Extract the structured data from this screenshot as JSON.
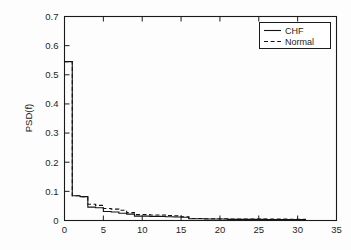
{
  "chart_data": {
    "type": "line",
    "title": "",
    "subtitle": "",
    "xlabel": "",
    "ylabel": "PSD(f)",
    "xlim": [
      0,
      35
    ],
    "ylim": [
      0,
      0.7
    ],
    "xticks": [
      0,
      5,
      10,
      15,
      20,
      25,
      30,
      35
    ],
    "xtick_labels": [
      "0",
      "5",
      "10",
      "15",
      "20",
      "25",
      "30",
      "35"
    ],
    "yticks": [
      0,
      0.1,
      0.2,
      0.3,
      0.4,
      0.5,
      0.6,
      0.7
    ],
    "ytick_labels": [
      "0",
      "0.1",
      "0.2",
      "0.3",
      "0.4",
      "0.5",
      "0.6",
      "0.7"
    ],
    "grid": false,
    "drawstyle": "steps-post",
    "legend_position": "top-right",
    "legend": [
      "CHF",
      "Normal"
    ],
    "x": [
      0,
      1,
      2,
      3,
      4,
      5,
      6,
      7,
      8,
      9,
      10,
      11,
      12,
      13,
      14,
      15,
      16,
      17,
      18,
      19,
      20,
      21,
      22,
      23,
      24,
      25,
      26,
      27,
      28,
      29,
      30,
      31
    ],
    "series": [
      {
        "name": "CHF",
        "linestyle": "solid",
        "color": "#141414",
        "values": [
          0.545,
          0.085,
          0.082,
          0.046,
          0.044,
          0.031,
          0.029,
          0.025,
          0.022,
          0.015,
          0.015,
          0.014,
          0.014,
          0.013,
          0.012,
          0.011,
          0.006,
          0.006,
          0.005,
          0.005,
          0.005,
          0.004,
          0.004,
          0.004,
          0.004,
          0.004,
          0.003,
          0.003,
          0.003,
          0.003,
          0.003,
          0.0
        ]
      },
      {
        "name": "Normal",
        "linestyle": "dashed",
        "color": "#141414",
        "values": [
          0.545,
          0.085,
          0.082,
          0.056,
          0.052,
          0.041,
          0.039,
          0.035,
          0.027,
          0.02,
          0.02,
          0.019,
          0.019,
          0.017,
          0.016,
          0.013,
          0.007,
          0.007,
          0.006,
          0.006,
          0.006,
          0.005,
          0.005,
          0.005,
          0.005,
          0.005,
          0.005,
          0.005,
          0.005,
          0.004,
          0.004,
          0.0
        ]
      }
    ]
  },
  "legend": {
    "items": [
      {
        "label": "CHF",
        "style": "solid"
      },
      {
        "label": "Normal",
        "style": "dashed"
      }
    ]
  },
  "axes": {
    "ylabel": "PSD(f)"
  }
}
